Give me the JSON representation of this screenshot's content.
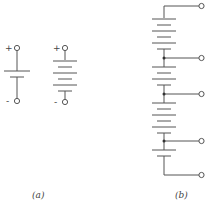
{
  "figure": {
    "part_a": {
      "caption": "(a)",
      "single_cell": {
        "plus_label": "+",
        "minus_label": "-"
      },
      "multi_cell": {
        "plus_label": "+",
        "minus_label": "-"
      }
    },
    "part_b": {
      "caption": "(b)",
      "terminals": 5
    }
  },
  "colors": {
    "line": "#555555",
    "background": "#ffffff"
  }
}
